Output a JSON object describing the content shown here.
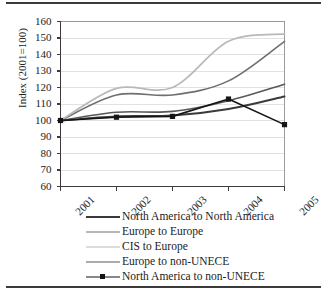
{
  "figure": {
    "background": "#ffffff",
    "frame_color": "#3b3b3b",
    "axis_color": "#3d3d3d",
    "grid_color": "#e2e2e2"
  },
  "chart_data": {
    "type": "line",
    "title": "",
    "xlabel": "",
    "ylabel": "Index (2001=100)",
    "categories": [
      "2001",
      "2002",
      "2003",
      "2004",
      "2005"
    ],
    "x": [
      2001,
      2002,
      2003,
      2004,
      2005
    ],
    "xlim": [
      2001,
      2005
    ],
    "ylim": [
      60,
      160
    ],
    "yticks": [
      60,
      70,
      80,
      90,
      100,
      110,
      120,
      130,
      140,
      150,
      160
    ],
    "ytick_labels": [
      "60",
      "70",
      "80",
      "90",
      "100",
      "110",
      "120",
      "130",
      "140",
      "150",
      "160"
    ],
    "xtick_labels": [
      "2001",
      "2002",
      "2003",
      "2004",
      "2005"
    ],
    "xtick_rotation": -45,
    "grid": "horizontal",
    "smoothing": "spline",
    "legend_position": "below",
    "series": [
      {
        "name": "North America to North America",
        "values": [
          100,
          102.5,
          103,
          107,
          114.5
        ],
        "color": "#3a3a3a",
        "width": 2.0,
        "marker": "none"
      },
      {
        "name": "Europe to Europe",
        "values": [
          100,
          115.5,
          115.5,
          124,
          148
        ],
        "color": "#6f6f6f",
        "width": 1.6,
        "marker": "none"
      },
      {
        "name": "CIS to Europe",
        "values": [
          100,
          119.5,
          120,
          148,
          152.5
        ],
        "color": "#b9b9b9",
        "width": 1.8,
        "marker": "none"
      },
      {
        "name": "Europe to non-UNECE",
        "values": [
          100,
          105,
          105.5,
          112,
          122
        ],
        "color": "#585858",
        "width": 1.6,
        "marker": "none"
      },
      {
        "name": "North America to non-UNECE",
        "values": [
          100,
          102,
          102.5,
          113,
          97.5
        ],
        "color": "#151515",
        "width": 1.6,
        "marker": "square"
      }
    ]
  },
  "legend": {
    "items": [
      {
        "label": "North America to North America"
      },
      {
        "label": "Europe to Europe"
      },
      {
        "label": "CIS to Europe"
      },
      {
        "label": "Europe to non-UNECE"
      },
      {
        "label": "North America to non-UNECE"
      }
    ]
  }
}
